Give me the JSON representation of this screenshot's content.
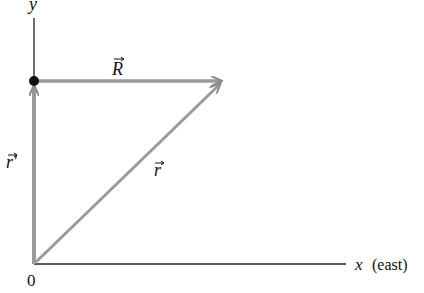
{
  "diagram": {
    "type": "vector-addition",
    "axes": {
      "y_label": "y",
      "x_label": "x",
      "x_direction": "(east)",
      "origin_label": "0"
    },
    "vectors": [
      {
        "name": "R",
        "label": "R",
        "from": "dot on y-axis",
        "to": "tip",
        "direction": "east"
      },
      {
        "name": "r_prime",
        "label": "r′",
        "from": "origin",
        "to": "dot on y-axis",
        "direction": "north"
      },
      {
        "name": "r",
        "label": "r",
        "from": "origin",
        "to": "tip",
        "direction": "north-east"
      }
    ],
    "colors": {
      "axis": "#222222",
      "vector": "#9a9a9a",
      "point": "#111111"
    }
  }
}
